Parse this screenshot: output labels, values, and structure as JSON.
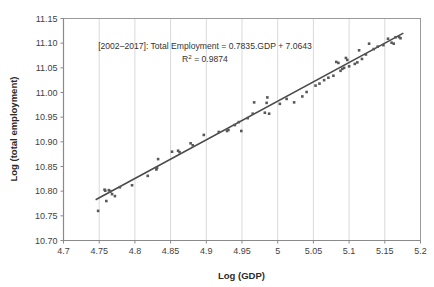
{
  "chart_data": {
    "type": "scatter",
    "title": "",
    "subtitle": "",
    "xlabel": "Log (GDP)",
    "ylabel": "Log (total employment)",
    "xlim": [
      4.7,
      5.2
    ],
    "ylim": [
      10.7,
      11.15
    ],
    "xticks": [
      "4.7",
      "4.75",
      "4.8",
      "4.85",
      "4.9",
      "4.95",
      "5",
      "5.05",
      "5.1",
      "5.15",
      "5.2"
    ],
    "xtick_values": [
      4.7,
      4.75,
      4.8,
      4.85,
      4.9,
      4.95,
      5.0,
      5.05,
      5.1,
      5.15,
      5.2
    ],
    "yticks": [
      "10.70",
      "10.75",
      "10.80",
      "10.85",
      "10.90",
      "10.95",
      "11.00",
      "11.05",
      "11.10",
      "11.15"
    ],
    "ytick_values": [
      10.7,
      10.75,
      10.8,
      10.85,
      10.9,
      10.95,
      11.0,
      11.05,
      11.1,
      11.15
    ],
    "grid": "vertical-only",
    "legend": "none",
    "marker_color": "#595959",
    "trendline_color": "#4a4a4a",
    "gridline_color": "#d9d9d9",
    "axis_color": "#9a9a9a",
    "annotations": [
      {
        "line1": "[2002–2017]: Total Employment = 0.7835.GDP + 7.0643",
        "line2_prefix": "R",
        "line2_sup": "2",
        "line2_suffix": " = 0.9874"
      }
    ],
    "equation": {
      "period": "[2002–2017]",
      "dependent": "Total Employment",
      "slope": 0.7835,
      "intercept": 7.0643,
      "r_squared": 0.9874
    },
    "trendline": {
      "x_start": 4.745,
      "y_start": 10.7827,
      "x_end": 5.176,
      "y_end": 11.1203
    },
    "points": [
      [
        4.7485,
        10.76
      ],
      [
        4.7575,
        10.803
      ],
      [
        4.7585,
        10.801
      ],
      [
        4.76,
        10.78
      ],
      [
        4.7635,
        10.802
      ],
      [
        4.765,
        10.799
      ],
      [
        4.766,
        10.8
      ],
      [
        4.768,
        10.794
      ],
      [
        4.772,
        10.79
      ],
      [
        4.779,
        10.808
      ],
      [
        4.796,
        10.812
      ],
      [
        4.818,
        10.831
      ],
      [
        4.83,
        10.844
      ],
      [
        4.831,
        10.847
      ],
      [
        4.8325,
        10.865
      ],
      [
        4.852,
        10.88
      ],
      [
        4.8605,
        10.882
      ],
      [
        4.8625,
        10.879
      ],
      [
        4.878,
        10.897
      ],
      [
        4.881,
        10.893
      ],
      [
        4.8965,
        10.914
      ],
      [
        4.9175,
        10.92
      ],
      [
        4.929,
        10.922
      ],
      [
        4.931,
        10.924
      ],
      [
        4.94,
        10.934
      ],
      [
        4.9455,
        10.94
      ],
      [
        4.949,
        10.922
      ],
      [
        4.958,
        10.948
      ],
      [
        4.965,
        10.957
      ],
      [
        4.967,
        10.98
      ],
      [
        4.982,
        10.959
      ],
      [
        4.9845,
        10.979
      ],
      [
        4.9855,
        10.99
      ],
      [
        4.988,
        10.957
      ],
      [
        5.003,
        10.977
      ],
      [
        5.0125,
        10.987
      ],
      [
        5.023,
        10.98
      ],
      [
        5.0345,
        10.992
      ],
      [
        5.0405,
        11.001
      ],
      [
        5.053,
        11.014
      ],
      [
        5.0585,
        11.018
      ],
      [
        5.065,
        11.025
      ],
      [
        5.071,
        11.03
      ],
      [
        5.078,
        11.034
      ],
      [
        5.082,
        11.062
      ],
      [
        5.085,
        11.06
      ],
      [
        5.088,
        11.044
      ],
      [
        5.0905,
        11.048
      ],
      [
        5.093,
        11.05
      ],
      [
        5.0955,
        11.07
      ],
      [
        5.0975,
        11.066
      ],
      [
        5.1,
        11.053
      ],
      [
        5.108,
        11.058
      ],
      [
        5.1115,
        11.061
      ],
      [
        5.114,
        11.0855
      ],
      [
        5.118,
        11.068
      ],
      [
        5.1235,
        11.077
      ],
      [
        5.128,
        11.099
      ],
      [
        5.1345,
        11.088
      ],
      [
        5.14,
        11.093
      ],
      [
        5.148,
        11.096
      ],
      [
        5.1545,
        11.109
      ],
      [
        5.1595,
        11.101
      ],
      [
        5.1625,
        11.099
      ],
      [
        5.165,
        11.112
      ],
      [
        5.17,
        11.1125
      ],
      [
        5.172,
        11.11
      ]
    ]
  }
}
